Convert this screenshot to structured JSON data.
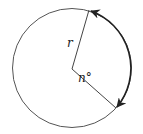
{
  "diagram": {
    "type": "circle-sector-arc",
    "labels": {
      "radius": "r",
      "angle": "n°"
    },
    "colors": {
      "stroke": "#555555",
      "arc": "#222222",
      "text": "#222222",
      "background": "#ffffff"
    }
  }
}
